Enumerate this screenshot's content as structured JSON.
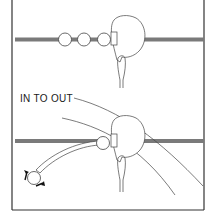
{
  "diagram": {
    "panels": [
      {
        "id": "top",
        "description": "Ball positions along target line with clubhead at address",
        "ball_count": 3
      },
      {
        "id": "bottom",
        "label": "IN TO OUT",
        "description": "Clubhead swing path curving from inside to outside across target line",
        "ball_count": 1
      }
    ],
    "colors": {
      "line": "#222222",
      "target_line": "#7a7a7a",
      "border": "#333333",
      "background": "#ffffff"
    }
  }
}
